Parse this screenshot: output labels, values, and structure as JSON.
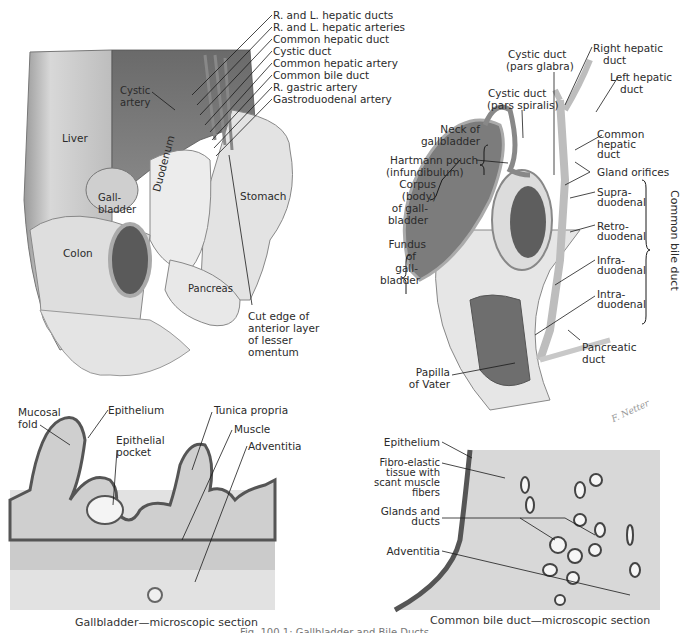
{
  "figure": {
    "caption_partial": "Fig. 100.1: Gallbladder and Bile Ducts"
  },
  "panel_top_left": {
    "name": "Gross anatomy of gallbladder and extrahepatic ducts",
    "region_labels": {
      "liver": "Liver",
      "cystic_artery": "Cystic artery",
      "gallbladder": "Gall-\nbladder",
      "duodenum": "Duodenum",
      "stomach": "Stomach",
      "colon": "Colon",
      "pancreas": "Pancreas"
    },
    "callouts": [
      "R. and L. hepatic ducts",
      "R. and L. hepatic arteries",
      "Common hepatic duct",
      "Cystic duct",
      "Common hepatic artery",
      "Common bile duct",
      "R. gastric artery",
      "Gastroduodenal artery"
    ],
    "cut_edge": [
      "Cut edge of",
      "anterior layer",
      "of lesser",
      "omentum"
    ]
  },
  "panel_top_right": {
    "name": "Gallbladder and bile duct sections",
    "labels": {
      "cystic_duct_glabra": [
        "Cystic duct",
        "(pars glabra)"
      ],
      "right_hepatic_duct": [
        "Right hepatic",
        "duct"
      ],
      "left_hepatic_duct": [
        "Left hepatic",
        "duct"
      ],
      "cystic_duct_spiralis": [
        "Cystic duct",
        "(pars spiralis)"
      ],
      "neck": [
        "Neck of",
        "gallbladder"
      ],
      "hartmann": [
        "Hartmann pouch",
        "(infundibulum)"
      ],
      "common_hepatic_duct": [
        "Common",
        "hepatic",
        "duct"
      ],
      "gland_orifices": "Gland orifices",
      "corpus": [
        "Corpus",
        "(body)",
        "of gall-",
        "bladder"
      ],
      "fundus": [
        "Fundus",
        "of",
        "gall-",
        "bladder"
      ],
      "supraduodenal": [
        "Supra-",
        "duodenal"
      ],
      "retroduodenal": [
        "Retro-",
        "duodenal"
      ],
      "infraduodenal": [
        "Infra-",
        "duodenal"
      ],
      "intraduodenal": [
        "Intra-",
        "duodenal"
      ],
      "pancreatic_duct": [
        "Pancreatic",
        "duct"
      ],
      "papilla": [
        "Papilla",
        "of Vater"
      ],
      "common_bile_duct_bracket": "Common bile duct",
      "signature": "F. Netter"
    }
  },
  "panel_bottom_left": {
    "title": "Gallbladder—microscopic section",
    "labels": {
      "mucosal_fold": [
        "Mucosal",
        "fold"
      ],
      "epithelium": "Epithelium",
      "epithelial_pocket": [
        "Epithelial",
        "pocket"
      ],
      "tunica_propria": "Tunica propria",
      "muscle": "Muscle",
      "adventitia": "Adventitia"
    }
  },
  "panel_bottom_right": {
    "title": "Common bile duct—microscopic section",
    "labels": {
      "epithelium": "Epithelium",
      "fibro_elastic": [
        "Fibro-elastic",
        "tissue with",
        "scant muscle",
        "fibers"
      ],
      "glands": [
        "Glands and",
        "ducts"
      ],
      "adventitia": "Adventitia"
    }
  },
  "colors": {
    "background": "#ffffff",
    "text": "#2b2b2b",
    "leader": "#1a1a1a",
    "tissue_light": "#d9d9d9",
    "tissue_mid": "#a8a8a8",
    "tissue_dark": "#5a5a5a"
  }
}
